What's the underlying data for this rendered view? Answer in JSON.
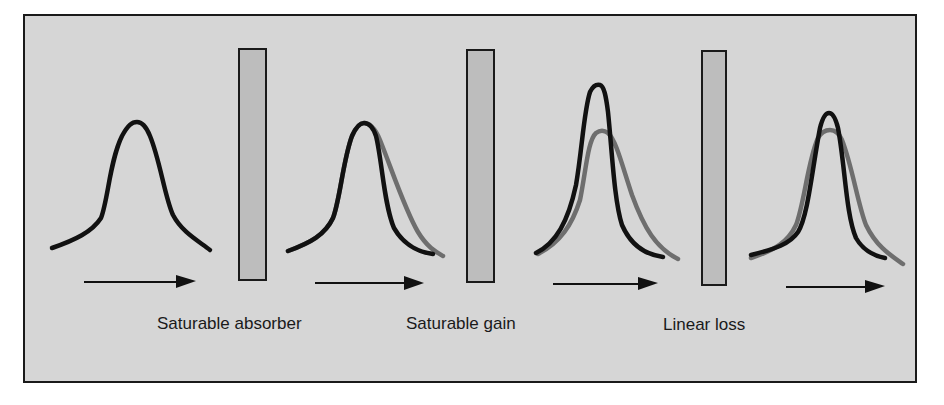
{
  "diagram": {
    "title": "",
    "colors": {
      "panel_background": "#d6d6d6",
      "panel_border": "#1a1a1a",
      "element_fill": "#bdbdbd",
      "pulse_current": "#111111",
      "pulse_previous": "#6e6e6e",
      "arrow": "#111111"
    },
    "elements": [
      {
        "id": "saturable-absorber",
        "label": "Saturable absorber"
      },
      {
        "id": "saturable-gain",
        "label": "Saturable gain"
      },
      {
        "id": "linear-loss",
        "label": "Linear loss"
      }
    ],
    "stages": [
      {
        "stage": 1,
        "description": "Input pulse",
        "has_previous_overlay": false
      },
      {
        "stage": 2,
        "description": "After saturable absorber: trailing edge steepened",
        "has_previous_overlay": true
      },
      {
        "stage": 3,
        "description": "After saturable gain: pulse amplified and narrowed",
        "has_previous_overlay": true
      },
      {
        "stage": 4,
        "description": "After linear loss: pulse attenuated, shorter than input",
        "has_previous_overlay": true
      }
    ],
    "direction_icon": "right-arrow-icon"
  }
}
